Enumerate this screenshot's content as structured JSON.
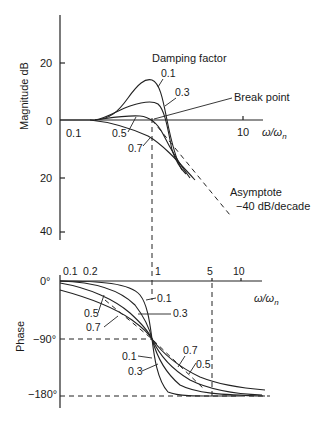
{
  "magnitude_plot": {
    "ylabel": "Magnitude dB",
    "y_ticks": [
      "20",
      "0",
      "20",
      "40"
    ],
    "x_ticks": [
      "0.1",
      "10"
    ],
    "x_label": "ω/ωn",
    "legend_title": "Damping factor",
    "curve_labels": [
      "0.1",
      "0.3",
      "0.5",
      "0.7"
    ],
    "break_point_label": "Break point",
    "asymptote_label": "Asymptote",
    "asymptote_slope": "−40 dB/decade"
  },
  "phase_plot": {
    "ylabel": "Phase",
    "y_ticks": [
      "0°",
      "−90°",
      "−180°"
    ],
    "x_ticks": [
      "0.1",
      "0.2",
      "1",
      "5",
      "10"
    ],
    "x_label": "ω/ωn",
    "curve_labels_left": [
      "0.5",
      "0.7"
    ],
    "curve_labels_mid": [
      "0.1",
      "0.3"
    ],
    "curve_labels_lower": [
      "0.1",
      "0.3"
    ],
    "curve_labels_right": [
      "0.7",
      "0.5"
    ]
  }
}
